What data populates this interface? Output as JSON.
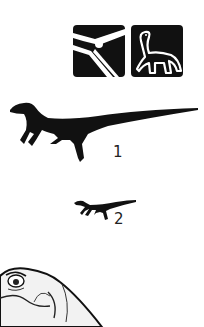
{
  "icons": [
    {
      "name": "pterosaur-icon",
      "description": "Pterosaur head and wing on black square"
    },
    {
      "name": "sauropodomorph-icon",
      "description": "Long-necked dinosaur on black square"
    }
  ],
  "specimens": [
    {
      "label": "1",
      "description": "Large small-theropod silhouette"
    },
    {
      "label": "2",
      "description": "Smaller theropod silhouette"
    }
  ],
  "colors": {
    "background": "#ffffff",
    "silhouette": "#111111",
    "label": "#222222"
  }
}
